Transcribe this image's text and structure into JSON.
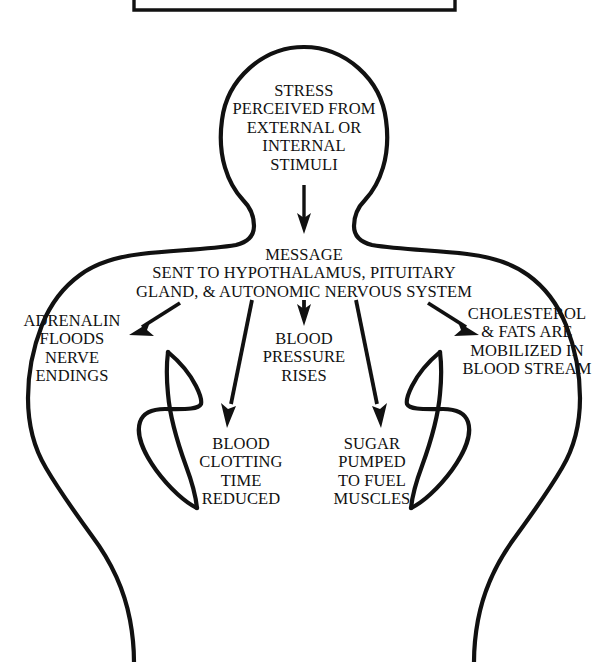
{
  "document": {
    "kind": "flow-diagram",
    "subject": "Physiological stress response cascade",
    "background_color": "#ffffff",
    "ink_color": "#111111"
  },
  "top_box": {
    "present": true,
    "description": "cut-off rectangle border at top edge of page"
  },
  "figure": {
    "type": "human-torso-silhouette",
    "stroke_color": "#111111"
  },
  "nodes": {
    "head": {
      "id": "stress-perceived",
      "text": "STRESS\nPERCEIVED FROM\nEXTERNAL OR\nINTERNAL\nSTIMULI"
    },
    "message": {
      "id": "message-sent",
      "text": "MESSAGE\nSENT TO HYPOTHALAMUS, PITUITARY\nGLAND, & AUTONOMIC NERVOUS SYSTEM"
    },
    "adrenalin": {
      "id": "adrenalin-floods",
      "text": "ADRENALIN\nFLOODS\nNERVE\nENDINGS"
    },
    "blood_pressure": {
      "id": "blood-pressure-rises",
      "text": "BLOOD\nPRESSURE\nRISES"
    },
    "cholesterol": {
      "id": "cholesterol-mobilized",
      "text": "CHOLESTEROL\n& FATS ARE\nMOBILIZED IN\nBLOOD STREAM"
    },
    "clotting": {
      "id": "blood-clotting-reduced",
      "text": "BLOOD\nCLOTTING\nTIME\nREDUCED"
    },
    "sugar": {
      "id": "sugar-pumped",
      "text": "SUGAR\nPUMPED\nTO FUEL\nMUSCLES"
    }
  },
  "arrows": [
    {
      "id": "head-to-message",
      "from": "stress-perceived",
      "to": "message-sent",
      "direction": "down"
    },
    {
      "id": "message-to-adrenalin",
      "from": "message-sent",
      "to": "adrenalin-floods",
      "direction": "down-left"
    },
    {
      "id": "message-to-clotting",
      "from": "message-sent",
      "to": "blood-clotting-reduced",
      "direction": "down-left-long"
    },
    {
      "id": "message-to-blood-pressure",
      "from": "message-sent",
      "to": "blood-pressure-rises",
      "direction": "down"
    },
    {
      "id": "message-to-sugar",
      "from": "message-sent",
      "to": "sugar-pumped",
      "direction": "down-right-long"
    },
    {
      "id": "message-to-cholesterol",
      "from": "message-sent",
      "to": "cholesterol-mobilized",
      "direction": "down-right"
    }
  ]
}
